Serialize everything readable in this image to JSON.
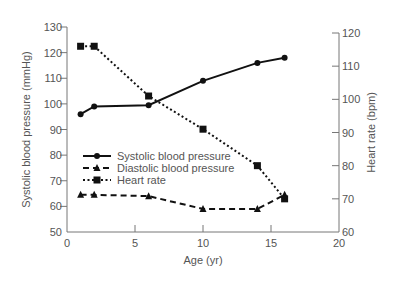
{
  "chart_data": {
    "type": "line",
    "title": "",
    "xlabel": "Age (yr)",
    "ylabel": "Systolic blood pressure (mmHg)",
    "y2label": "Heart rate (bpm)",
    "xlim": [
      0,
      20
    ],
    "ylim": [
      50,
      130
    ],
    "y2lim": [
      60,
      120
    ],
    "xticks": [
      0,
      5,
      10,
      15,
      20
    ],
    "yticks": [
      50,
      60,
      70,
      80,
      90,
      100,
      110,
      120,
      130
    ],
    "y2ticks": [
      60,
      70,
      80,
      90,
      100,
      110,
      120
    ],
    "grid": false,
    "legend_position": "inside-lower-left",
    "series": [
      {
        "name": "Systolic blood pressure",
        "axis": "left",
        "style": "solid",
        "marker": "circle",
        "x": [
          1,
          2,
          6,
          10,
          14,
          16
        ],
        "values": [
          96,
          99,
          99.5,
          109,
          116,
          118
        ]
      },
      {
        "name": "Diastolic blood pressure",
        "axis": "left",
        "style": "dashed",
        "marker": "triangle",
        "x": [
          1,
          2,
          6,
          10,
          14,
          16
        ],
        "values": [
          64.5,
          64.5,
          64,
          59,
          59,
          64.5
        ]
      },
      {
        "name": "Heart rate",
        "axis": "right",
        "style": "dotted",
        "marker": "square",
        "x": [
          1,
          2,
          6,
          10,
          14,
          16
        ],
        "values": [
          116,
          116,
          101,
          91,
          80,
          70
        ]
      }
    ]
  }
}
